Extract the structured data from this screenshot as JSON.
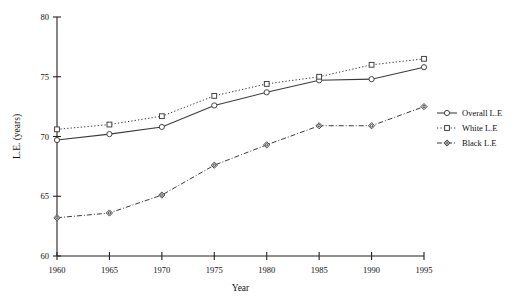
{
  "chart_data": {
    "type": "line",
    "title": "",
    "xlabel": "Year",
    "ylabel": "L.E. (years)",
    "x": [
      1960,
      1965,
      1970,
      1975,
      1980,
      1985,
      1990,
      1995
    ],
    "xtick_labels": [
      "1960",
      "1965",
      "1970",
      "1975",
      "1980",
      "1985",
      "1990",
      "1995"
    ],
    "ytick_labels": [
      "60",
      "65",
      "70",
      "75",
      "80"
    ],
    "yticks": [
      60,
      65,
      70,
      75,
      80
    ],
    "xlim": [
      1960,
      1995
    ],
    "ylim": [
      60,
      80
    ],
    "grid": false,
    "legend_position": "right",
    "series": [
      {
        "name": "Overall L.E",
        "marker": "circle",
        "linestyle": "solid",
        "color": "#3a3a3a",
        "values": [
          69.7,
          70.2,
          70.8,
          72.6,
          73.7,
          74.7,
          74.8,
          75.8
        ]
      },
      {
        "name": "White L.E",
        "marker": "square",
        "linestyle": "dotted",
        "color": "#3a3a3a",
        "values": [
          70.6,
          71.0,
          71.7,
          73.4,
          74.4,
          75.0,
          76.0,
          76.5
        ]
      },
      {
        "name": "Black L.E",
        "marker": "diamond",
        "linestyle": "dash-dot",
        "color": "#3a3a3a",
        "values": [
          63.2,
          63.6,
          65.1,
          67.6,
          69.3,
          70.9,
          70.9,
          72.5
        ]
      }
    ]
  },
  "axes": {
    "x_title": "Year",
    "y_title": "L.E. (years)"
  },
  "legend": {
    "items": [
      {
        "label": "Overall L.E"
      },
      {
        "label": "White L.E"
      },
      {
        "label": "Black L.E"
      }
    ]
  }
}
